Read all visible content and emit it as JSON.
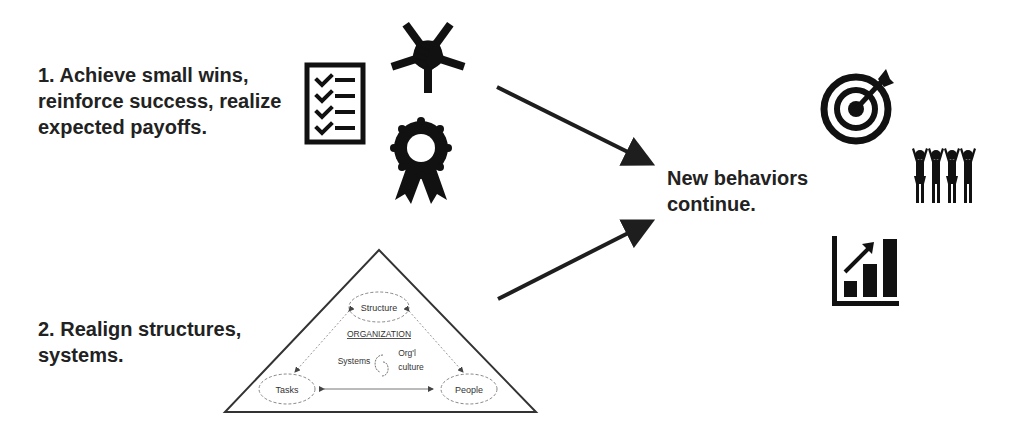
{
  "steps": [
    {
      "id": 1,
      "text": "1. Achieve small wins, reinforce success, realize expected payoffs.",
      "icons": [
        "checklist-icon",
        "teamwork-hands-icon",
        "award-ribbon-icon"
      ]
    },
    {
      "id": 2,
      "text": "2. Realign structures, systems."
    }
  ],
  "result": {
    "text": "New behaviors continue.",
    "icons": [
      "target-arrow-icon",
      "celebrating-team-icon",
      "growth-chart-icon"
    ]
  },
  "organization_triangle": {
    "title": "ORGANIZATION",
    "nodes": {
      "top": "Structure",
      "left": "Tasks",
      "right": "People"
    },
    "center_left": "Systems",
    "center_right_line1": "Org'l",
    "center_right_line2": "culture"
  },
  "colors": {
    "ink": "#1e1e1e",
    "background": "#ffffff",
    "line": "#333333"
  }
}
